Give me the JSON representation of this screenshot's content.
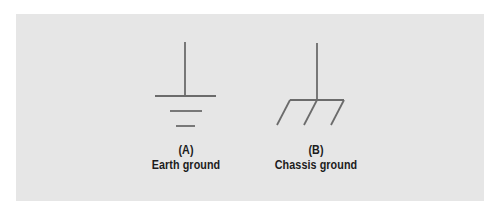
{
  "diagram": {
    "background": "#e6e6e6",
    "stroke_color": "#6b6b6b",
    "symbols": [
      {
        "id": "A",
        "letter": "(A)",
        "name": "Earth ground",
        "icon": "earth-ground-icon"
      },
      {
        "id": "B",
        "letter": "(B)",
        "name": "Chassis ground",
        "icon": "chassis-ground-icon"
      }
    ]
  }
}
